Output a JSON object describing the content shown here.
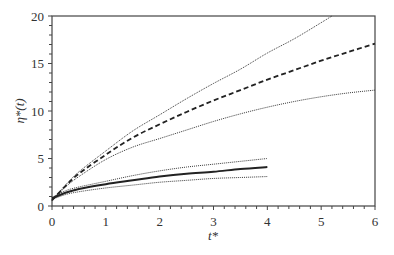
{
  "chart_data": {
    "type": "line",
    "title": "",
    "xlabel": "t*",
    "ylabel": "η*(t)",
    "xlim": [
      0,
      6
    ],
    "ylim": [
      0,
      20
    ],
    "xticks": [
      0,
      1,
      2,
      3,
      4,
      5,
      6
    ],
    "yticks": [
      0,
      5,
      10,
      15,
      20
    ],
    "grid": false,
    "legend": null,
    "series": [
      {
        "name": "upper group upper bound",
        "style": "dotted",
        "x": [
          0,
          0.25,
          0.5,
          1,
          1.5,
          2,
          2.5,
          3,
          3.5,
          4,
          4.5,
          5,
          5.2
        ],
        "y": [
          0.6,
          2.2,
          3.6,
          5.8,
          7.9,
          9.6,
          11.3,
          12.9,
          14.4,
          16.1,
          17.6,
          19.3,
          20
        ]
      },
      {
        "name": "upper group mean",
        "style": "dashed",
        "x": [
          0,
          0.25,
          0.5,
          1,
          1.5,
          2,
          2.5,
          3,
          3.5,
          4,
          4.5,
          5,
          5.5,
          6
        ],
        "y": [
          0.6,
          2.1,
          3.4,
          5.4,
          7.2,
          8.6,
          9.9,
          11.1,
          12.2,
          13.3,
          14.3,
          15.3,
          16.2,
          17.1
        ]
      },
      {
        "name": "upper group lower bound",
        "style": "dotted",
        "x": [
          0,
          0.25,
          0.5,
          1,
          1.5,
          2,
          2.5,
          3,
          3.5,
          4,
          4.5,
          5,
          5.5,
          6
        ],
        "y": [
          0.6,
          2.0,
          3.1,
          4.9,
          6.2,
          7.1,
          8.0,
          8.9,
          9.7,
          10.4,
          11.0,
          11.5,
          11.9,
          12.2
        ]
      },
      {
        "name": "lower group upper bound",
        "style": "dotted",
        "x": [
          0,
          0.25,
          0.5,
          1,
          1.5,
          2,
          2.5,
          3,
          3.5,
          4
        ],
        "y": [
          0.9,
          1.6,
          2.0,
          2.6,
          3.2,
          3.7,
          4.1,
          4.4,
          4.7,
          5.0
        ]
      },
      {
        "name": "lower group mean",
        "style": "solid",
        "x": [
          0,
          0.25,
          0.5,
          1,
          1.5,
          2,
          2.5,
          3,
          3.5,
          4
        ],
        "y": [
          0.8,
          1.4,
          1.8,
          2.3,
          2.7,
          3.1,
          3.4,
          3.6,
          3.9,
          4.1
        ]
      },
      {
        "name": "lower group lower bound",
        "style": "dotted",
        "x": [
          0,
          0.25,
          0.5,
          1,
          1.5,
          2,
          2.5,
          3,
          3.5,
          4
        ],
        "y": [
          0.7,
          1.2,
          1.5,
          1.9,
          2.2,
          2.5,
          2.7,
          2.9,
          3.0,
          3.1
        ]
      }
    ]
  },
  "colors": {
    "line": "#222222",
    "axis": "#444444"
  }
}
